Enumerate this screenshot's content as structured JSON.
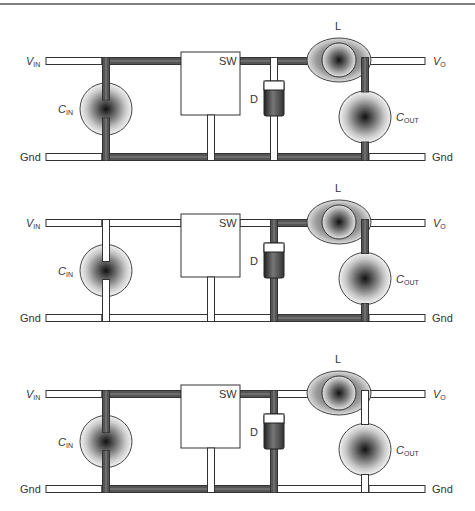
{
  "figure": {
    "colors": {
      "background": "#ffffff",
      "trace_outline": "#333333",
      "trace_active": "#555555",
      "trace_inactive": "#ffffff",
      "frame_line": "#555555"
    }
  },
  "labels": {
    "vin_main": "V",
    "vin_sub": "IN",
    "vo_main": "V",
    "vo_sub": "O",
    "gnd": "Gnd",
    "cin_main": "C",
    "cin_sub": "IN",
    "cout_main": "C",
    "cout_sub": "OUT",
    "switch": "SW",
    "diode": "D",
    "inductor": "L"
  },
  "panels": [
    {
      "name": "switch-on-loop",
      "active_segments": [
        "cin",
        "vin_cin_sw",
        "sw_l",
        "inductor",
        "cout",
        "gnd_cin_sw",
        "gnd_sw_d",
        "gnd_d_cout"
      ]
    },
    {
      "name": "switch-off-loop",
      "active_segments": [
        "diode",
        "d_l",
        "inductor",
        "cout",
        "gnd_d_cout"
      ]
    },
    {
      "name": "difference-loop",
      "active_segments": [
        "cin",
        "vin_cin_sw",
        "sw_d",
        "diode",
        "gnd_cin_sw",
        "gnd_sw_d"
      ]
    }
  ]
}
